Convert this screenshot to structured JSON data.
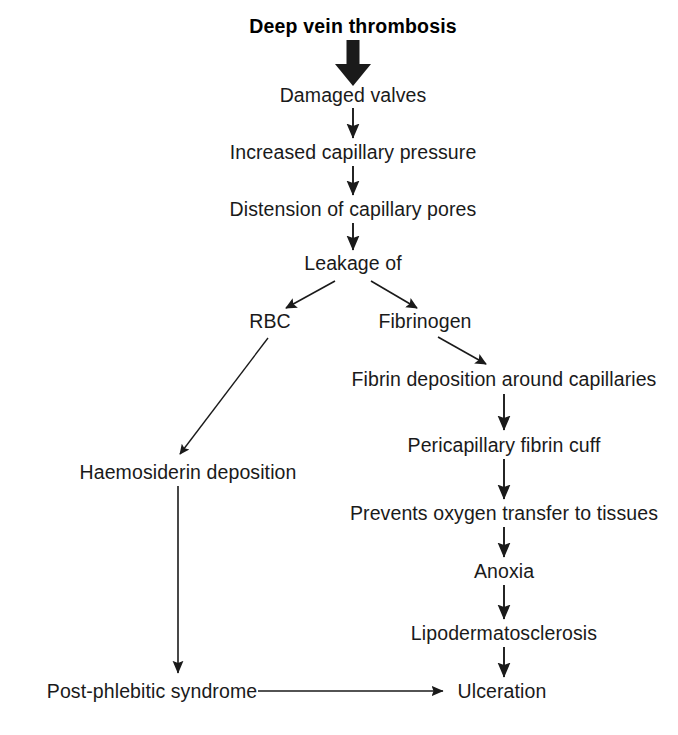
{
  "diagram": {
    "title": "Deep vein thrombosis",
    "type": "flowchart",
    "orientation": "top-down",
    "canvas": {
      "width": 678,
      "height": 735
    },
    "colors": {
      "background": "#ffffff",
      "text": "#1a1a1a",
      "stroke": "#1a1a1a"
    },
    "nodes": [
      {
        "id": "dvt",
        "label": "Deep vein thrombosis",
        "x": 353,
        "y": 27,
        "bold": true
      },
      {
        "id": "valves",
        "label": "Damaged valves",
        "x": 353,
        "y": 96,
        "bold": false
      },
      {
        "id": "pressure",
        "label": "Increased capillary pressure",
        "x": 353,
        "y": 153,
        "bold": false
      },
      {
        "id": "pores",
        "label": "Distension of capillary pores",
        "x": 353,
        "y": 210,
        "bold": false
      },
      {
        "id": "leakage",
        "label": "Leakage of",
        "x": 353,
        "y": 264,
        "bold": false
      },
      {
        "id": "rbc",
        "label": "RBC",
        "x": 270,
        "y": 322,
        "bold": false
      },
      {
        "id": "fibrinogen",
        "label": "Fibrinogen",
        "x": 425,
        "y": 322,
        "bold": false
      },
      {
        "id": "fibrin_dep",
        "label": "Fibrin deposition around capillaries",
        "x": 504,
        "y": 380,
        "bold": false
      },
      {
        "id": "cuff",
        "label": "Pericapillary fibrin cuff",
        "x": 504,
        "y": 446,
        "bold": false
      },
      {
        "id": "prevents",
        "label": "Prevents oxygen transfer to tissues",
        "x": 504,
        "y": 514,
        "bold": false
      },
      {
        "id": "anoxia",
        "label": "Anoxia",
        "x": 504,
        "y": 572,
        "bold": false
      },
      {
        "id": "lipo",
        "label": "Lipodermatosclerosis",
        "x": 504,
        "y": 634,
        "bold": false
      },
      {
        "id": "haemo",
        "label": "Haemosiderin deposition",
        "x": 188,
        "y": 473,
        "bold": false
      },
      {
        "id": "postphleb",
        "label": "Post-phlebitic syndrome",
        "x": 152,
        "y": 692,
        "bold": false
      },
      {
        "id": "ulceration",
        "label": "Ulceration",
        "x": 502,
        "y": 692,
        "bold": false
      }
    ],
    "edges": [
      {
        "id": "e-dvt-valves",
        "from": "dvt",
        "to": "valves",
        "style": "thick-vertical"
      },
      {
        "id": "e-valves-pressure",
        "from": "valves",
        "to": "pressure",
        "style": "vertical"
      },
      {
        "id": "e-pressure-pores",
        "from": "pressure",
        "to": "pores",
        "style": "vertical"
      },
      {
        "id": "e-pores-leakage",
        "from": "pores",
        "to": "leakage",
        "style": "vertical"
      },
      {
        "id": "e-leakage-rbc",
        "from": "leakage",
        "to": "rbc",
        "style": "diagonal-left"
      },
      {
        "id": "e-leakage-fibrinogen",
        "from": "leakage",
        "to": "fibrinogen",
        "style": "diagonal-right"
      },
      {
        "id": "e-fibrinogen-fibrin",
        "from": "fibrinogen",
        "to": "fibrin_dep",
        "style": "diagonal-right"
      },
      {
        "id": "e-fibrin-cuff",
        "from": "fibrin_dep",
        "to": "cuff",
        "style": "vertical"
      },
      {
        "id": "e-cuff-prevents",
        "from": "cuff",
        "to": "prevents",
        "style": "vertical"
      },
      {
        "id": "e-prevents-anoxia",
        "from": "prevents",
        "to": "anoxia",
        "style": "vertical"
      },
      {
        "id": "e-anoxia-lipo",
        "from": "anoxia",
        "to": "lipo",
        "style": "vertical"
      },
      {
        "id": "e-lipo-ulceration",
        "from": "lipo",
        "to": "ulceration",
        "style": "vertical"
      },
      {
        "id": "e-rbc-haemo",
        "from": "rbc",
        "to": "haemo",
        "style": "diagonal-left-long"
      },
      {
        "id": "e-haemo-postphleb",
        "from": "haemo",
        "to": "postphleb",
        "style": "vertical-long"
      },
      {
        "id": "e-postphleb-ulcer",
        "from": "postphleb",
        "to": "ulceration",
        "style": "horizontal"
      }
    ]
  }
}
